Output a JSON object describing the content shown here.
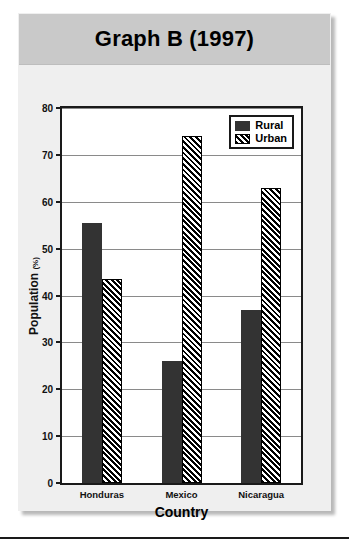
{
  "figure": {
    "title": "Graph B (1997)"
  },
  "chart_data": {
    "type": "bar",
    "title": "Graph B (1997)",
    "xlabel": "Country",
    "ylabel": "Population",
    "ylabel_unit": "(%)",
    "categories": [
      "Honduras",
      "Mexico",
      "Nicaragua"
    ],
    "series": [
      {
        "name": "Rural",
        "values": [
          55.5,
          26,
          37
        ],
        "color": "#333333",
        "fill": "solid"
      },
      {
        "name": "Urban",
        "values": [
          43.5,
          74,
          63
        ],
        "color": "#000000",
        "fill": "diagonal-hatch"
      }
    ],
    "ylim": [
      0,
      80
    ],
    "yticks": [
      0,
      10,
      20,
      30,
      40,
      50,
      60,
      70,
      80
    ],
    "ytick_labels": [
      "0",
      "10",
      "20",
      "30",
      "40",
      "50",
      "60",
      "70",
      "80"
    ],
    "grid": true,
    "legend_position": "top-right"
  }
}
